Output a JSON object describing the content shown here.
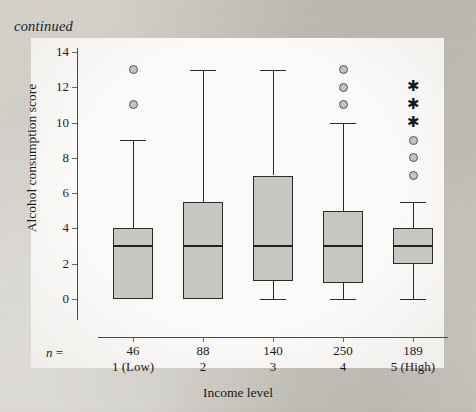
{
  "page": {
    "header_note": "continued",
    "background_color": "#d2cfc9",
    "panel_color": "#fbfaf8"
  },
  "labels": {
    "n_prefix": "n =",
    "x_axis_title": "Income level",
    "y_axis_title": "Alcohol consumption score"
  },
  "chart_data": {
    "type": "box",
    "title": "",
    "xlabel": "Income level",
    "ylabel": "Alcohol consumption score",
    "ylim": [
      0,
      14
    ],
    "ytick_labels": [
      "0",
      "2",
      "4",
      "6",
      "8",
      "10",
      "12",
      "14"
    ],
    "ytick_values": [
      0,
      2,
      4,
      6,
      8,
      10,
      12,
      14
    ],
    "grid": false,
    "legend": "none",
    "categories": [
      "1 (Low)",
      "2",
      "3",
      "4",
      "5 (High)"
    ],
    "sample_sizes": [
      46,
      88,
      140,
      250,
      189
    ],
    "sample_size_labels": [
      "46",
      "88",
      "140",
      "250",
      "189"
    ],
    "boxes": [
      {
        "category": "1 (Low)",
        "n": 46,
        "whisker_low": 0,
        "q1": 0,
        "median": 3,
        "q3": 4,
        "whisker_high": 9,
        "outliers": [
          13,
          11
        ],
        "extremes": []
      },
      {
        "category": "2",
        "n": 88,
        "whisker_low": 0,
        "q1": 0,
        "median": 3,
        "q3": 5.5,
        "whisker_high": 13,
        "outliers": [],
        "extremes": []
      },
      {
        "category": "3",
        "n": 140,
        "whisker_low": 0,
        "q1": 1,
        "median": 3,
        "q3": 7,
        "whisker_high": 13,
        "outliers": [],
        "extremes": []
      },
      {
        "category": "4",
        "n": 250,
        "whisker_low": 0,
        "q1": 0.9,
        "median": 3,
        "q3": 5,
        "whisker_high": 10,
        "outliers": [
          13,
          12,
          11
        ],
        "extremes": []
      },
      {
        "category": "5 (High)",
        "n": 189,
        "whisker_low": 0,
        "q1": 2,
        "median": 3,
        "q3": 4,
        "whisker_high": 5.5,
        "outliers": [
          9,
          8,
          7
        ],
        "extremes": [
          12,
          11,
          10
        ]
      }
    ],
    "colors": {
      "box_fill": "#c9c7c3",
      "box_edge": "#2c2b29",
      "median_line": "#232220",
      "outlier_marker": "#c4c2be",
      "extreme_marker": "#1a1918"
    }
  }
}
